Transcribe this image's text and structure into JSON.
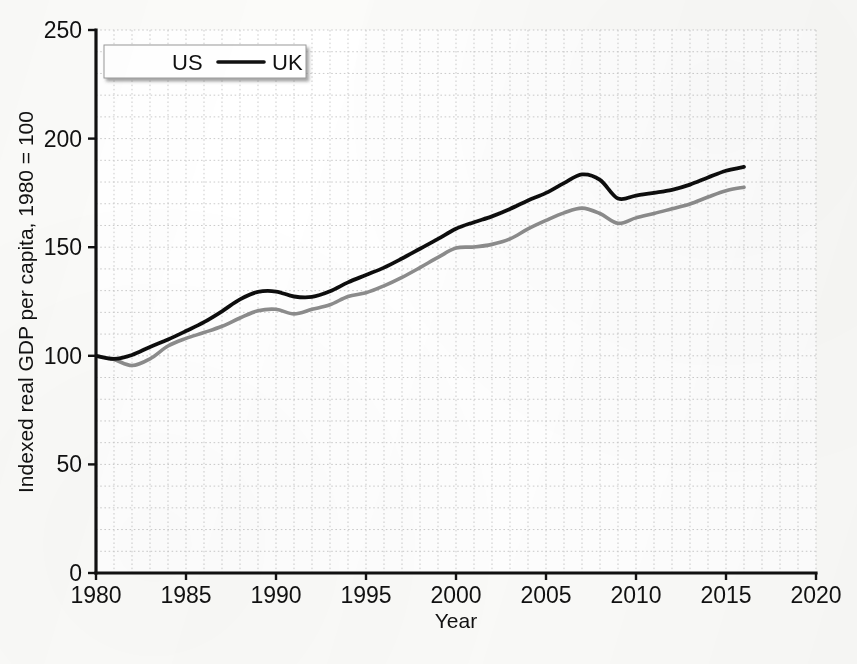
{
  "chart_data": {
    "type": "line",
    "title": "",
    "xlabel": "Year",
    "ylabel": "Indexed real GDP per capita, 1980 = 100",
    "xlim": [
      1980,
      2020
    ],
    "ylim": [
      0,
      250
    ],
    "xticks": [
      "1980",
      "1985",
      "1990",
      "1995",
      "2000",
      "2005",
      "2010",
      "2015",
      "2020"
    ],
    "yticks": [
      "0",
      "50",
      "100",
      "150",
      "200",
      "250"
    ],
    "grid": "minor dotted gridlines, 1 year by 10 index units",
    "legend_position": "upper left",
    "x": [
      1980,
      1981,
      1982,
      1983,
      1984,
      1985,
      1986,
      1987,
      1988,
      1989,
      1990,
      1991,
      1992,
      1993,
      1994,
      1995,
      1996,
      1997,
      1998,
      1999,
      2000,
      2001,
      2002,
      2003,
      2004,
      2005,
      2006,
      2007,
      2008,
      2009,
      2010,
      2011,
      2012,
      2013,
      2014,
      2015,
      2016
    ],
    "series": [
      {
        "name": "US",
        "color": "#8c8c8c",
        "values": [
          100.0,
          98.3,
          95.5,
          98.6,
          104.5,
          108.0,
          110.7,
          113.6,
          117.4,
          120.7,
          121.4,
          119.3,
          121.4,
          123.5,
          127.3,
          129.0,
          132.2,
          136.1,
          140.6,
          145.3,
          149.6,
          150.1,
          151.3,
          153.8,
          158.4,
          162.3,
          165.8,
          168.0,
          165.5,
          161.0,
          163.5,
          165.5,
          167.7,
          169.9,
          173.1,
          176.0,
          177.6
        ]
      },
      {
        "name": "UK",
        "color": "#111111",
        "values": [
          100.0,
          98.6,
          100.4,
          104.1,
          107.5,
          111.4,
          115.5,
          120.5,
          126.0,
          129.4,
          129.6,
          127.3,
          127.1,
          129.7,
          133.8,
          137.2,
          140.6,
          144.8,
          149.3,
          153.8,
          158.5,
          161.5,
          164.2,
          167.6,
          171.5,
          175.0,
          179.5,
          183.5,
          181.0,
          172.4,
          173.8,
          175.0,
          176.4,
          178.8,
          182.1,
          185.2,
          187.0
        ]
      }
    ],
    "legend": [
      {
        "label": "US",
        "swatch": "gray-line"
      },
      {
        "label": "UK",
        "swatch": "black-line"
      }
    ]
  },
  "axes": {
    "y_axis_title": "Indexed real GDP per capita, 1980 = 100",
    "x_axis_title": "Year"
  }
}
